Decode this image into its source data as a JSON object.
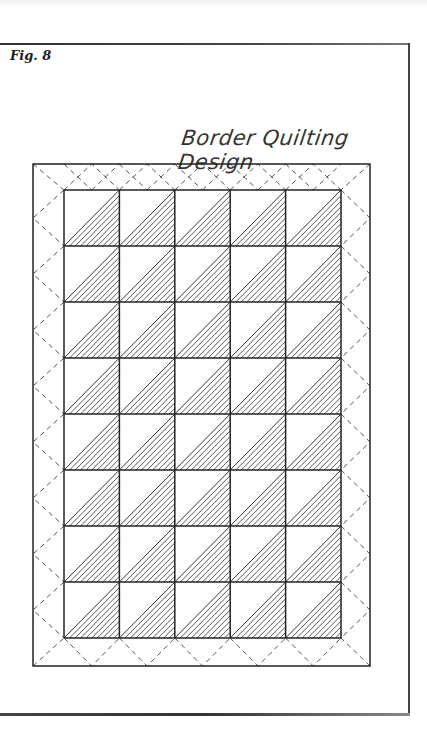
{
  "figure": {
    "label": "Fig. 8",
    "title": "Border Quilting Design"
  },
  "quilt": {
    "columns": 5,
    "rows": 8,
    "hatched_triangle": "lower-left",
    "border_pattern": "dashed-diagonal-diamonds",
    "line_color": "#222222",
    "dash_color": "#555555"
  }
}
